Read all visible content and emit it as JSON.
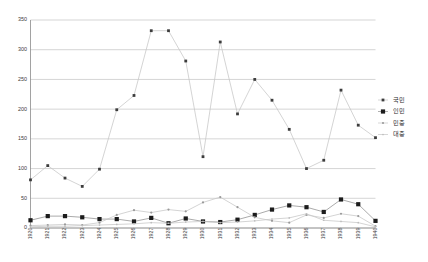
{
  "chart_data": {
    "type": "line",
    "title": "",
    "subtitle": "",
    "xlabel": "",
    "ylabel": "",
    "xlim": [
      1920,
      1940
    ],
    "ylim": [
      0,
      350
    ],
    "ytick_step": 50,
    "grid": true,
    "legend_position": "right",
    "categories": [
      "1920",
      "1921",
      "1922",
      "1923",
      "1924",
      "1925",
      "1926",
      "1927",
      "1928",
      "1929",
      "1930",
      "1931",
      "1932",
      "1933",
      "1934",
      "1935",
      "1936",
      "1937",
      "1938",
      "1939",
      "1940"
    ],
    "yticks": [
      0,
      50,
      100,
      150,
      200,
      250,
      300,
      350
    ],
    "series": [
      {
        "name": "국민",
        "marker": "small-square",
        "color": "#3c3c3c",
        "values": [
          81,
          105,
          84,
          70,
          99,
          199,
          223,
          332,
          332,
          281,
          120,
          313,
          192,
          250,
          215,
          166,
          100,
          114,
          232,
          173,
          152
        ]
      },
      {
        "name": "인민",
        "marker": "large-square",
        "color": "#1c1c1c",
        "values": [
          13,
          20,
          20,
          18,
          15,
          15,
          11,
          17,
          8,
          16,
          11,
          10,
          14,
          22,
          31,
          38,
          35,
          27,
          48,
          40,
          12
        ]
      },
      {
        "name": "민중",
        "marker": "small-dot",
        "color": "#9a9a9a",
        "values": [
          4,
          5,
          6,
          5,
          9,
          22,
          30,
          26,
          31,
          28,
          43,
          52,
          35,
          18,
          12,
          9,
          22,
          17,
          24,
          20,
          3
        ]
      },
      {
        "name": "대중",
        "marker": "tiny-dot",
        "color": "#bdbdbd",
        "values": [
          2,
          3,
          3,
          4,
          5,
          6,
          7,
          9,
          8,
          10,
          11,
          9,
          10,
          12,
          15,
          17,
          24,
          13,
          11,
          9,
          2
        ]
      }
    ]
  },
  "legend": {
    "entries": [
      {
        "label": "국민"
      },
      {
        "label": "인민"
      },
      {
        "label": "민중"
      },
      {
        "label": "대중"
      }
    ]
  }
}
